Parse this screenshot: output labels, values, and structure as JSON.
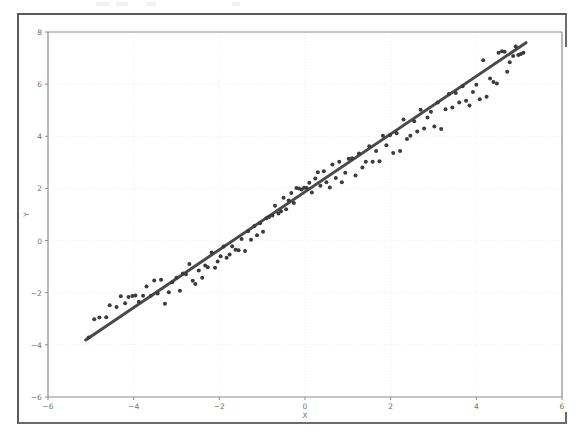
{
  "figure": {
    "background_color": "#ffffff",
    "frame_color": "#5a5a5f",
    "scan_artifacts": [
      {
        "left": 96,
        "width": 14
      },
      {
        "left": 116,
        "width": 12
      },
      {
        "left": 146,
        "width": 10
      },
      {
        "left": 232,
        "width": 8
      }
    ]
  },
  "axis_titles": {
    "x": "X",
    "y": "Y"
  },
  "chart_data": {
    "type": "scatter",
    "title": "",
    "subtitle": "",
    "xlabel": "X",
    "ylabel": "Y",
    "xlim": [
      -6,
      6
    ],
    "ylim": [
      -6,
      8
    ],
    "xticks": [
      -6,
      -4,
      -2,
      0,
      2,
      4,
      6
    ],
    "yticks": [
      -6,
      -4,
      -2,
      0,
      2,
      4,
      6,
      8
    ],
    "xtick_labels": [
      "−6",
      "−4",
      "−2",
      "0",
      "2",
      "4",
      "6"
    ],
    "ytick_labels": [
      "−6",
      "−4",
      "−2",
      "0",
      "2",
      "4",
      "6",
      "8"
    ],
    "grid": true,
    "grid_color": "#eeeef2",
    "grid_style": "dotted",
    "legend": null,
    "legend_position": "none",
    "series": [
      {
        "name": "observations",
        "type": "scatter",
        "marker": "circle",
        "marker_size": 3.1,
        "color": "#3b3b3f",
        "points": [
          [
            -5.05,
            -3.72
          ],
          [
            -4.92,
            -3.02
          ],
          [
            -4.8,
            -2.95
          ],
          [
            -4.64,
            -2.94
          ],
          [
            -4.56,
            -2.48
          ],
          [
            -4.4,
            -2.55
          ],
          [
            -4.3,
            -2.14
          ],
          [
            -4.2,
            -2.4
          ],
          [
            -4.12,
            -2.16
          ],
          [
            -4.03,
            -2.13
          ],
          [
            -3.96,
            -2.11
          ],
          [
            -3.88,
            -2.35
          ],
          [
            -3.78,
            -2.12
          ],
          [
            -3.7,
            -1.76
          ],
          [
            -3.6,
            -2.12
          ],
          [
            -3.52,
            -1.53
          ],
          [
            -3.44,
            -2.03
          ],
          [
            -3.36,
            -1.5
          ],
          [
            -3.27,
            -2.42
          ],
          [
            -3.18,
            -1.98
          ],
          [
            -3.1,
            -1.6
          ],
          [
            -3.0,
            -1.43
          ],
          [
            -2.92,
            -1.92
          ],
          [
            -2.85,
            -1.26
          ],
          [
            -2.78,
            -1.29
          ],
          [
            -2.7,
            -0.9
          ],
          [
            -2.62,
            -1.54
          ],
          [
            -2.56,
            -1.67
          ],
          [
            -2.48,
            -1.15
          ],
          [
            -2.4,
            -1.43
          ],
          [
            -2.33,
            -0.96
          ],
          [
            -2.27,
            -1.02
          ],
          [
            -2.18,
            -0.46
          ],
          [
            -2.1,
            -1.04
          ],
          [
            -2.04,
            -0.8
          ],
          [
            -1.97,
            -0.6
          ],
          [
            -1.9,
            -0.23
          ],
          [
            -1.83,
            -0.66
          ],
          [
            -1.76,
            -0.53
          ],
          [
            -1.7,
            -0.22
          ],
          [
            -1.62,
            -0.35
          ],
          [
            -1.55,
            -0.37
          ],
          [
            -1.48,
            0.06
          ],
          [
            -1.4,
            -0.4
          ],
          [
            -1.33,
            0.36
          ],
          [
            -1.26,
            0.03
          ],
          [
            -1.18,
            0.56
          ],
          [
            -1.12,
            0.2
          ],
          [
            -1.05,
            0.66
          ],
          [
            -0.98,
            0.34
          ],
          [
            -0.9,
            0.86
          ],
          [
            -0.84,
            0.9
          ],
          [
            -0.76,
            0.96
          ],
          [
            -0.7,
            1.34
          ],
          [
            -0.62,
            1.04
          ],
          [
            -0.56,
            1.12
          ],
          [
            -0.5,
            1.64
          ],
          [
            -0.44,
            1.2
          ],
          [
            -0.38,
            1.54
          ],
          [
            -0.32,
            1.82
          ],
          [
            -0.26,
            1.44
          ],
          [
            -0.2,
            2.02
          ],
          [
            -0.14,
            2.0
          ],
          [
            -0.08,
            1.96
          ],
          [
            -0.02,
            2.03
          ],
          [
            0.04,
            2.02
          ],
          [
            0.1,
            2.22
          ],
          [
            0.16,
            1.84
          ],
          [
            0.24,
            2.38
          ],
          [
            0.3,
            2.62
          ],
          [
            0.36,
            2.1
          ],
          [
            0.44,
            2.66
          ],
          [
            0.5,
            2.24
          ],
          [
            0.58,
            2.04
          ],
          [
            0.64,
            2.92
          ],
          [
            0.72,
            2.4
          ],
          [
            0.8,
            3.02
          ],
          [
            0.86,
            2.24
          ],
          [
            0.94,
            2.6
          ],
          [
            1.02,
            3.14
          ],
          [
            1.1,
            3.16
          ],
          [
            1.18,
            2.5
          ],
          [
            1.26,
            3.34
          ],
          [
            1.34,
            2.8
          ],
          [
            1.42,
            3.02
          ],
          [
            1.5,
            3.62
          ],
          [
            1.58,
            3.02
          ],
          [
            1.66,
            3.44
          ],
          [
            1.74,
            3.04
          ],
          [
            1.82,
            4.02
          ],
          [
            1.9,
            3.66
          ],
          [
            1.98,
            4.04
          ],
          [
            2.06,
            3.36
          ],
          [
            2.14,
            4.12
          ],
          [
            2.22,
            3.44
          ],
          [
            2.3,
            4.64
          ],
          [
            2.38,
            3.9
          ],
          [
            2.46,
            4.02
          ],
          [
            2.55,
            4.58
          ],
          [
            2.62,
            4.18
          ],
          [
            2.7,
            5.02
          ],
          [
            2.78,
            4.3
          ],
          [
            2.86,
            4.72
          ],
          [
            2.94,
            4.94
          ],
          [
            3.02,
            4.38
          ],
          [
            3.1,
            5.3
          ],
          [
            3.18,
            4.28
          ],
          [
            3.28,
            5.04
          ],
          [
            3.36,
            5.62
          ],
          [
            3.44,
            5.1
          ],
          [
            3.52,
            5.66
          ],
          [
            3.6,
            5.3
          ],
          [
            3.68,
            5.92
          ],
          [
            3.76,
            5.36
          ],
          [
            3.84,
            5.18
          ],
          [
            3.92,
            5.7
          ],
          [
            4.0,
            5.98
          ],
          [
            4.08,
            5.42
          ],
          [
            4.16,
            6.92
          ],
          [
            4.24,
            5.52
          ],
          [
            4.32,
            6.22
          ],
          [
            4.4,
            6.08
          ],
          [
            4.48,
            6.02
          ],
          [
            4.52,
            7.2
          ],
          [
            4.6,
            7.26
          ],
          [
            4.66,
            7.24
          ],
          [
            4.72,
            6.48
          ],
          [
            4.78,
            6.84
          ],
          [
            4.86,
            7.08
          ],
          [
            4.92,
            7.44
          ],
          [
            4.98,
            7.12
          ],
          [
            5.04,
            7.16
          ],
          [
            5.1,
            7.2
          ]
        ]
      },
      {
        "name": "regression-line",
        "type": "line",
        "color": "#4a4a4e",
        "line_width": 3.0,
        "slope": 1.108,
        "intercept": 1.87,
        "x_start": -5.12,
        "x_end": 5.16,
        "y_start": -3.81,
        "y_end": 7.59
      }
    ]
  }
}
